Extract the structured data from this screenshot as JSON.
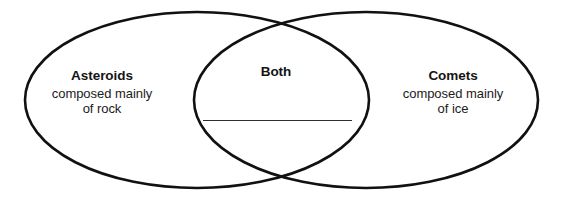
{
  "diagram": {
    "type": "venn",
    "background_color": "#ffffff",
    "stroke_color": "#111111",
    "stroke_width": 2.6,
    "text_color": "#1b1b1b",
    "blank_line_color": "#2c2f33"
  },
  "left_set": {
    "name": "asteroids",
    "title": "Asteroids",
    "description_line_1": "composed mainly",
    "description_line_2": "of rock"
  },
  "right_set": {
    "name": "comets",
    "title": "Comets",
    "description_line_1": "composed mainly",
    "description_line_2": "of ice"
  },
  "center_set": {
    "name": "both",
    "title": "Both",
    "answer_blank": ""
  },
  "geometry": {
    "left_ellipse": {
      "cx": 197,
      "cy": 100,
      "rx": 172,
      "ry": 88
    },
    "right_ellipse": {
      "cx": 366,
      "cy": 100,
      "rx": 172,
      "ry": 88
    }
  }
}
